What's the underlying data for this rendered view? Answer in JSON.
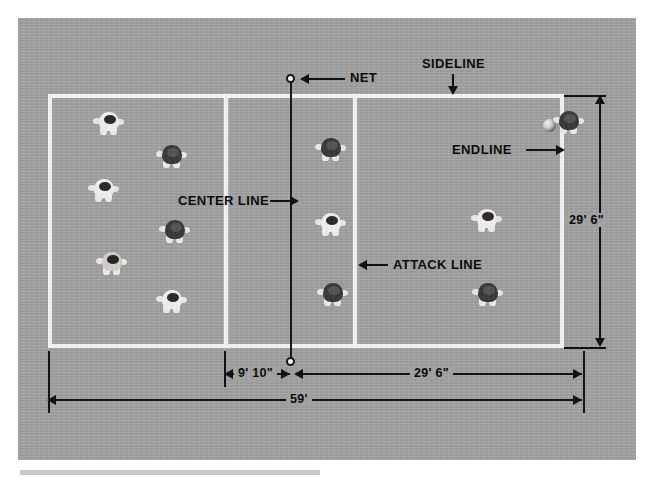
{
  "figure": {
    "surface_color": "#a2a2a2",
    "line_color": "#f2f2f2",
    "annotation_color": "#0a0a0a"
  },
  "labels": {
    "net": "NET",
    "sideline": "SIDELINE",
    "endline": "ENDLINE",
    "center_line": "CENTER LINE",
    "attack_line": "ATTACK LINE"
  },
  "dimensions": {
    "court_width_vertical": "29' 6\"",
    "attack_zone_depth": "9' 10\"",
    "half_court_length": "29' 6\"",
    "full_court_length": "59'"
  },
  "court": {
    "lines": [
      {
        "name": "endline-left",
        "kind": "endline"
      },
      {
        "name": "endline-right",
        "kind": "endline"
      },
      {
        "name": "sideline-top",
        "kind": "sideline"
      },
      {
        "name": "sideline-bottom",
        "kind": "sideline"
      },
      {
        "name": "attack-line-left",
        "kind": "attack-line"
      },
      {
        "name": "attack-line-right",
        "kind": "attack-line"
      },
      {
        "name": "center-line",
        "kind": "center-line"
      }
    ]
  },
  "players": [
    {
      "id": "p1",
      "team": "left",
      "uniform": "light",
      "x": 92,
      "y": 107
    },
    {
      "id": "p2",
      "team": "left",
      "uniform": "dark",
      "x": 155,
      "y": 140
    },
    {
      "id": "p3",
      "team": "left",
      "uniform": "light",
      "x": 87,
      "y": 174
    },
    {
      "id": "p4",
      "team": "left",
      "uniform": "dark",
      "x": 158,
      "y": 215
    },
    {
      "id": "p5",
      "team": "left",
      "uniform": "mid",
      "x": 95,
      "y": 247
    },
    {
      "id": "p6",
      "team": "left",
      "uniform": "light",
      "x": 155,
      "y": 285
    },
    {
      "id": "p7",
      "team": "net",
      "uniform": "dark",
      "x": 314,
      "y": 133
    },
    {
      "id": "p8",
      "team": "net",
      "uniform": "light",
      "x": 314,
      "y": 208
    },
    {
      "id": "p9",
      "team": "net",
      "uniform": "dark",
      "x": 316,
      "y": 278
    },
    {
      "id": "p10",
      "team": "right",
      "uniform": "light",
      "x": 470,
      "y": 204
    },
    {
      "id": "p11",
      "team": "right",
      "uniform": "dark",
      "x": 471,
      "y": 278
    },
    {
      "id": "p12",
      "team": "right",
      "uniform": "dark",
      "x": 552,
      "y": 106
    }
  ],
  "balls": [
    {
      "id": "b1",
      "x": 543,
      "y": 119
    }
  ]
}
